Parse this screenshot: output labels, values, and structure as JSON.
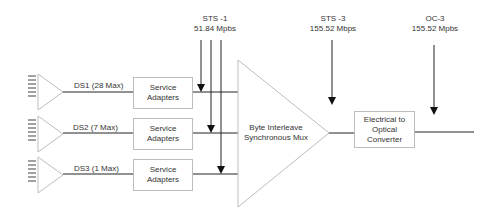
{
  "rates": {
    "sts1": {
      "name": "STS -1",
      "rate": "51.84 Mpbs"
    },
    "sts3": {
      "name": "STS -3",
      "rate": "155.52 Mbps"
    },
    "oc3": {
      "name": "OC-3",
      "rate": "155.52 Mpbs"
    }
  },
  "inputs": [
    {
      "label": "DS1 (28 Max)",
      "adapter_line1": "Service",
      "adapter_line2": "Adapters"
    },
    {
      "label": "DS2 (7 Max)",
      "adapter_line1": "Service",
      "adapter_line2": "Adapters"
    },
    {
      "label": "DS3 (1 Max)",
      "adapter_line1": "Service",
      "adapter_line2": "Adapters"
    }
  ],
  "mux": {
    "line1": "Byte Interleave",
    "line2": "Synchronous Mux"
  },
  "converter": {
    "line1": "Electrical to",
    "line2": "Optical",
    "line3": "Converter"
  },
  "colors": {
    "line": "#222222",
    "shape_stroke": "#bdbdbd",
    "text": "#333333"
  }
}
